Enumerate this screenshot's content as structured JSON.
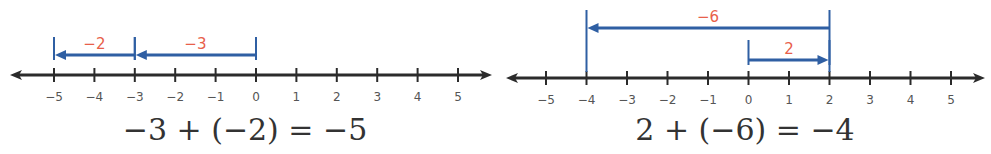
{
  "colors": {
    "axis": "#2b2b2b",
    "jump": "#2f5fa3",
    "jump_label": "#e8604a",
    "tick_label": "#555555",
    "equation": "#333333"
  },
  "chart_data": [
    {
      "type": "number-line",
      "title": "",
      "range": [
        -5,
        5
      ],
      "ticks": [
        -5,
        -4,
        -3,
        -2,
        -1,
        0,
        1,
        2,
        3,
        4,
        5
      ],
      "tick_labels": [
        "−5",
        "−4",
        "−3",
        "−2",
        "−1",
        "0",
        "1",
        "2",
        "3",
        "4",
        "5"
      ],
      "jumps": [
        {
          "from": 0,
          "to": -3,
          "label": "−3",
          "row": 1
        },
        {
          "from": -3,
          "to": -5,
          "label": "−2",
          "row": 1
        }
      ],
      "equation": "−3 + (−2) = −5"
    },
    {
      "type": "number-line",
      "title": "",
      "range": [
        -5,
        5
      ],
      "ticks": [
        -5,
        -4,
        -3,
        -2,
        -1,
        0,
        1,
        2,
        3,
        4,
        5
      ],
      "tick_labels": [
        "−5",
        "−4",
        "−3",
        "−2",
        "−1",
        "0",
        "1",
        "2",
        "3",
        "4",
        "5"
      ],
      "jumps": [
        {
          "from": 0,
          "to": 2,
          "label": "2",
          "row": 1
        },
        {
          "from": 2,
          "to": -4,
          "label": "−6",
          "row": 2
        }
      ],
      "equation": "2 + (−6) = −4"
    }
  ]
}
